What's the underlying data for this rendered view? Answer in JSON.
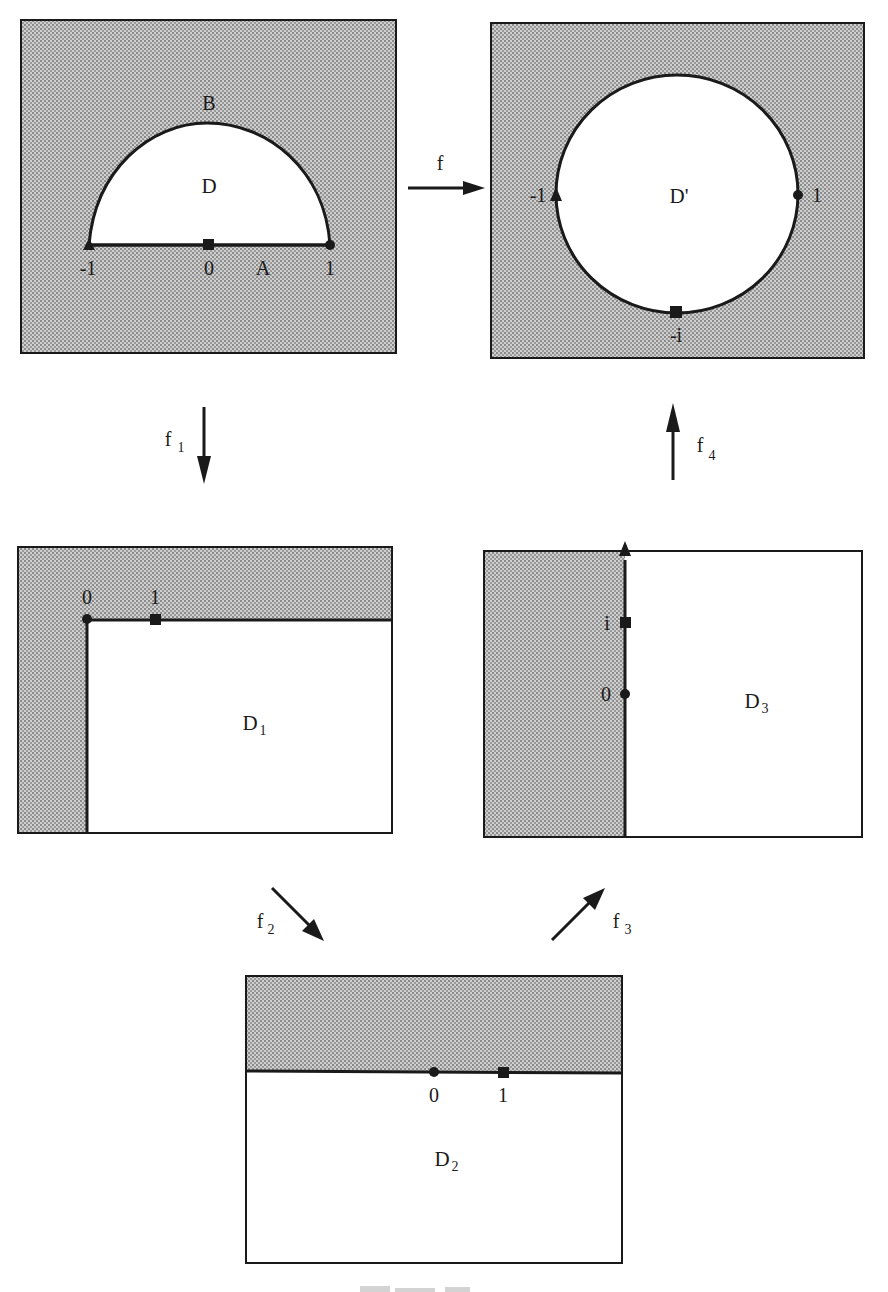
{
  "colors": {
    "shade": "#b8b8b8",
    "ink": "#1a1a1a",
    "background": "#ffffff"
  },
  "panels": {
    "D": {
      "region_label": "D",
      "arc_label": "B",
      "segment_label": "A",
      "points": [
        {
          "label": "-1",
          "marker": "triangle"
        },
        {
          "label": "0",
          "marker": "square"
        },
        {
          "label": "1",
          "marker": "circle"
        }
      ]
    },
    "Dprime": {
      "region_label": "D'",
      "points": [
        {
          "label": "-1",
          "marker": "triangle"
        },
        {
          "label": "1",
          "marker": "circle"
        },
        {
          "label": "-i",
          "marker": "square"
        }
      ]
    },
    "D1": {
      "region_label": "D",
      "region_sub": "1",
      "points": [
        {
          "label": "0",
          "marker": "circle"
        },
        {
          "label": "1",
          "marker": "square"
        }
      ]
    },
    "D3": {
      "region_label": "D",
      "region_sub": "3",
      "points": [
        {
          "label": "i",
          "marker": "square"
        },
        {
          "label": "0",
          "marker": "circle"
        }
      ],
      "axis_end_marker": "triangle"
    },
    "D2": {
      "region_label": "D",
      "region_sub": "2",
      "points": [
        {
          "label": "0",
          "marker": "circle"
        },
        {
          "label": "1",
          "marker": "square"
        }
      ]
    }
  },
  "maps": {
    "f": {
      "label": "f",
      "sub": ""
    },
    "f1": {
      "label": "f",
      "sub": "1"
    },
    "f2": {
      "label": "f",
      "sub": "2"
    },
    "f3": {
      "label": "f",
      "sub": "3"
    },
    "f4": {
      "label": "f",
      "sub": "4"
    }
  }
}
